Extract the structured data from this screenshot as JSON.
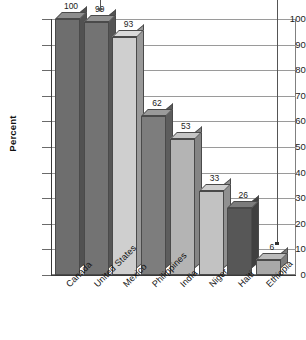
{
  "chart_data": {
    "type": "bar",
    "title": "",
    "xlabel": "",
    "ylabel": "Percent",
    "ylim": [
      0,
      100
    ],
    "ytick_step": 10,
    "grid": true,
    "legend": "none",
    "style": "3d-bar",
    "categories": [
      "Canada",
      "United States",
      "Mexico",
      "Philippines",
      "India",
      "Niger",
      "Haiti",
      "Ethiopia"
    ],
    "values": [
      100,
      99,
      93,
      62,
      53,
      33,
      26,
      6
    ],
    "value_labels": [
      "100",
      "99",
      "93",
      "62",
      "53",
      "33",
      "26",
      "6"
    ],
    "ytick_labels": [
      "100",
      "90",
      "80",
      "70",
      "60",
      "50",
      "40",
      "30",
      "20",
      "10",
      "0"
    ],
    "bar_colors": [
      "#6e6e6e",
      "#737373",
      "#cfcfcf",
      "#7d7d7d",
      "#b4b4b4",
      "#c2c2c2",
      "#575757",
      "#a8a8a8"
    ],
    "annotations": [
      {
        "name": "arrow-to-united-states",
        "target": "United States",
        "type": "down-arrow"
      },
      {
        "name": "leader-line-right",
        "type": "vertical-line",
        "ends_at_percent": 12
      }
    ]
  },
  "axis": {
    "y_title": "Percent"
  }
}
